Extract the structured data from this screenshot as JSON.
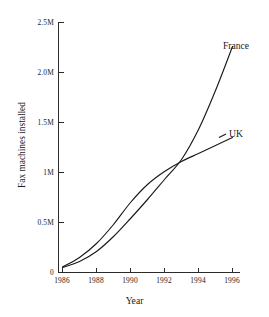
{
  "chart_data": {
    "type": "line",
    "title": "",
    "xlabel": "Year",
    "ylabel": "Fax machines installed",
    "xlim": [
      1986,
      1996.5
    ],
    "ylim": [
      0,
      2500000
    ],
    "grid": false,
    "legend_position": "inline-right-of-line-ends",
    "x_tick_labels": [
      "1986",
      "1988",
      "1990",
      "1992",
      "1994",
      "1996"
    ],
    "x_tick_values": [
      1986,
      1988,
      1990,
      1992,
      1994,
      1996
    ],
    "y_tick_labels": [
      "0",
      "0.5M",
      "1M",
      "1.5M",
      "2.0M",
      "2.5M"
    ],
    "y_tick_values": [
      0,
      500000,
      1000000,
      1500000,
      2000000,
      2500000
    ],
    "x": [
      1986,
      1987,
      1988,
      1989,
      1990,
      1991,
      1992,
      1993,
      1994,
      1995,
      1996
    ],
    "series": [
      {
        "name": "UK",
        "label": "UK",
        "color": "#1a1a1a",
        "values": [
          55000,
          150000,
          290000,
          480000,
          700000,
          880000,
          1010000,
          1110000,
          1190000,
          1270000,
          1350000
        ]
      },
      {
        "name": "France",
        "label": "France",
        "color": "#1a1a1a",
        "values": [
          50000,
          110000,
          210000,
          360000,
          540000,
          730000,
          930000,
          1130000,
          1430000,
          1820000,
          2260000
        ]
      }
    ],
    "annotations": [
      {
        "text": "crossover",
        "x": 1993,
        "y": 1130000
      }
    ]
  }
}
